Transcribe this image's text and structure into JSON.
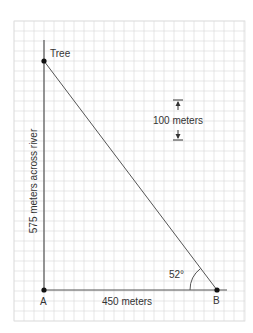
{
  "diagram": {
    "grid": {
      "x0": 14,
      "y0": 21,
      "x1": 245,
      "y1": 321,
      "cell": 10,
      "color": "#d6d6d6",
      "border": "#e0e0e0"
    },
    "points": {
      "tree": {
        "label": "Tree",
        "x": 44,
        "y": 61
      },
      "a": {
        "label": "A",
        "x": 44,
        "y": 290
      },
      "b": {
        "label": "B",
        "x": 217,
        "y": 290
      }
    },
    "labels": {
      "vertical_side": "575 meters across river",
      "horizontal_side": "450 meters",
      "angle": "52°",
      "scale": "100 meters"
    },
    "scale_indicator": {
      "x": 178,
      "y_top": 100,
      "y_bottom": 140
    },
    "line_color": "#555555",
    "point_color": "#111111"
  }
}
